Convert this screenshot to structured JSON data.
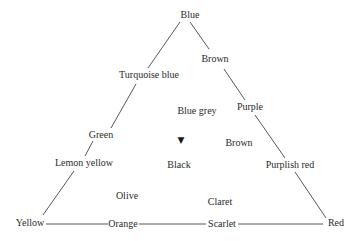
{
  "diagram": {
    "type": "color-mixing-triangle",
    "vertices": {
      "top": "Blue",
      "bottom_left": "Yellow",
      "bottom_right": "Red"
    },
    "left_edge": [
      "Turquoise blue",
      "Green",
      "Lemon yellow"
    ],
    "right_edge": [
      "Brown",
      "Purple",
      "Purplish red"
    ],
    "bottom_edge": [
      "Orange",
      "Scarlet"
    ],
    "interior": [
      "Blue grey",
      "Brown",
      "Black",
      "Olive",
      "Claret"
    ],
    "marker": "▼",
    "line_color": "#444444",
    "text_color": "#2a2a2a"
  },
  "labels": {
    "blue": "Blue",
    "brown_top": "Brown",
    "turquoise_blue": "Turquoise blue",
    "blue_grey": "Blue grey",
    "purple": "Purple",
    "green": "Green",
    "brown_mid": "Brown",
    "lemon_yellow": "Lemon yellow",
    "black": "Black",
    "purplish_red": "Purplish red",
    "olive": "Olive",
    "claret": "Claret",
    "yellow": "Yellow",
    "orange": "Orange",
    "scarlet": "Scarlet",
    "red": "Red",
    "marker": "▼"
  }
}
